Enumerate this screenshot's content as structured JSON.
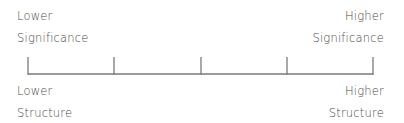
{
  "diagram": {
    "type": "scale",
    "top_left": {
      "line1": "Lower",
      "line2": "Significance"
    },
    "top_right": {
      "line1": "Higher",
      "line2": "Significance"
    },
    "bottom_left": {
      "line1": "Lower",
      "line2": "Structure"
    },
    "bottom_right": {
      "line1": "Higher",
      "line2": "Structure"
    },
    "tick_count": 5,
    "line_color": "#7a7a7a",
    "text_color": "#4a4a4a"
  }
}
